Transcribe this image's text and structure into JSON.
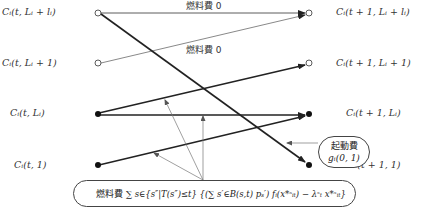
{
  "diagram": {
    "type": "state-transition-network",
    "left_nodes": [
      {
        "id": "L4",
        "label": "C_i(t, L_i + l_i)",
        "style": "open"
      },
      {
        "id": "L3",
        "label": "C_i(t, L_i + 1)",
        "style": "open"
      },
      {
        "id": "L2",
        "label": "C_i(t, L_i)",
        "style": "filled"
      },
      {
        "id": "L1",
        "label": "C_i(t, 1)",
        "style": "filled"
      }
    ],
    "right_nodes": [
      {
        "id": "R4",
        "label": "C_i(t + 1, L_i + l_i)",
        "style": "open"
      },
      {
        "id": "R3",
        "label": "C_i(t + 1, L_i + 1)",
        "style": "open"
      },
      {
        "id": "R2",
        "label": "C_i(t + 1, L_i)",
        "style": "filled"
      },
      {
        "id": "R1",
        "label": "C_i(t + 1, 1)",
        "style": "filled"
      }
    ],
    "edges": [
      {
        "from": "L4",
        "to": "R4",
        "label": "燃料費 0",
        "weight": "thin"
      },
      {
        "from": "L3",
        "to": "R4",
        "label": "燃料費 0",
        "weight": "thin"
      },
      {
        "from": "L4",
        "to": "R1",
        "label": "",
        "weight": "thick"
      },
      {
        "from": "L2",
        "to": "R3",
        "label": "",
        "weight": "thick"
      },
      {
        "from": "L2",
        "to": "R2",
        "label": "",
        "weight": "thick"
      },
      {
        "from": "L1",
        "to": "R2",
        "label": "",
        "weight": "thick"
      }
    ],
    "edge_labels": {
      "top": "燃料費 0",
      "second": "燃料費 0"
    },
    "startup_cost": {
      "title": "起動費",
      "formula": "g_i(0, 1)"
    },
    "fuel_cost": {
      "title": "燃料費",
      "formula": "∑_{s∈{s''|T(s'')≤t}} {(∑_{s'∈B(s,t)} p_{s'}) f_i(x_{it}^{*s}) − λ_t^s x_{it}^{*s}}"
    }
  },
  "labels": {
    "L4": "Cᵢ(t, Lᵢ + lᵢ)",
    "L3": "Cᵢ(t, Lᵢ + 1)",
    "L2": "Cᵢ(t, Lᵢ)",
    "L1": "Cᵢ(t, 1)",
    "R4": "Cᵢ(t + 1, Lᵢ + lᵢ)",
    "R3": "Cᵢ(t + 1, Lᵢ + 1)",
    "R2": "Cᵢ(t + 1, Lᵢ)",
    "R1": "Cᵢ(t + 1, 1)",
    "edge_top": "燃料費 0",
    "edge_second": "燃料費 0",
    "startup_title": "起動費",
    "startup_formula": "gᵢ(0, 1)",
    "fuel_title": "燃料費",
    "fuel_formula": "∑ s∈{s″|T(s″)≤t} {(∑ s′∈B(s,t) pₛ′) fᵢ(x*ˢᵢₜ) − λˢₜ x*ˢᵢₜ}"
  }
}
